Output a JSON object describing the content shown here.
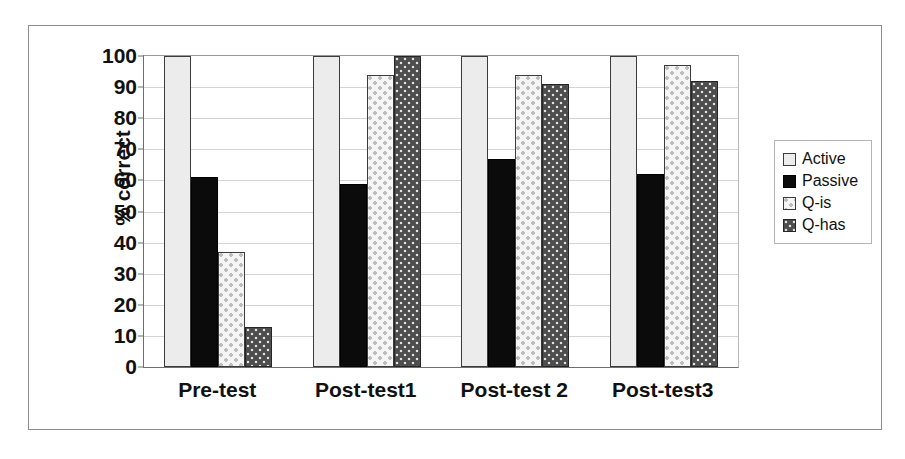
{
  "chart_data": {
    "type": "bar",
    "title": "",
    "xlabel": "",
    "ylabel": "% correct",
    "ylim": [
      0,
      100
    ],
    "yticks": [
      0,
      10,
      20,
      30,
      40,
      50,
      60,
      70,
      80,
      90,
      100
    ],
    "grid": true,
    "legend_position": "right",
    "categories": [
      "Pre-test",
      "Post-test1",
      "Post-test 2",
      "Post-test3"
    ],
    "series": [
      {
        "name": "Active",
        "values": [
          100,
          100,
          100,
          100
        ],
        "fill": "light-solid",
        "color": "#ececec"
      },
      {
        "name": "Passive",
        "values": [
          61,
          59,
          67,
          62
        ],
        "fill": "black-solid",
        "color": "#0b0b0b"
      },
      {
        "name": "Q-is",
        "values": [
          37,
          94,
          94,
          97
        ],
        "fill": "light-dotted",
        "color": "#f5f5f5"
      },
      {
        "name": "Q-has",
        "values": [
          13,
          100,
          91,
          92
        ],
        "fill": "dark-dotted",
        "color": "#4d4d4d"
      }
    ]
  },
  "axis": {
    "y_title": "% correct",
    "y_tick_labels": [
      "100",
      "90",
      "80",
      "70",
      "60",
      "50",
      "40",
      "30",
      "20",
      "10",
      "0"
    ],
    "x_tick_labels": [
      "Pre-test",
      "Post-test1",
      "Post-test 2",
      "Post-test3"
    ]
  },
  "legend": {
    "items": [
      {
        "label": "Active"
      },
      {
        "label": "Passive"
      },
      {
        "label": "Q-is"
      },
      {
        "label": "Q-has"
      }
    ]
  },
  "caption": {
    "text": ""
  }
}
